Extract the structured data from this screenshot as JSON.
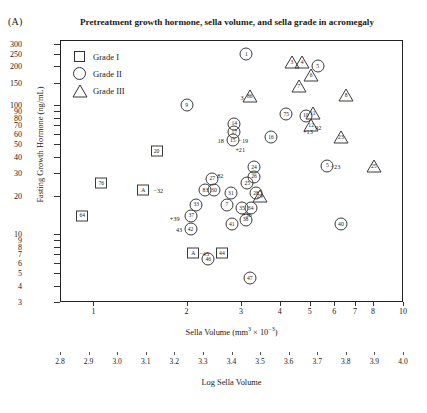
{
  "panel": {
    "label": "(A)"
  },
  "title": "Pretreatment growth hormone, sella volume, and sella grade in acromegaly",
  "legend": {
    "items": [
      {
        "symbol": "square",
        "label": "Grade I"
      },
      {
        "symbol": "circle",
        "label": "Grade II"
      },
      {
        "symbol": "triangle",
        "label": "Grade III"
      }
    ]
  },
  "chart_data": {
    "type": "scatter",
    "title": "Pretreatment growth hormone, sella volume, and sella grade in acromegaly",
    "xlabel": "Sella Volume (mm³ × 10⁻³)",
    "xlabel_secondary": "Log Sella Volume",
    "ylabel": "Fasting Growth Hormone (ng/mL)",
    "xscale": "log",
    "yscale": "log",
    "xlim": [
      0.78,
      10.0
    ],
    "ylim": [
      3,
      320
    ],
    "grid": false,
    "legend_position": "top-left inside axes",
    "xticks": [
      1,
      2,
      3,
      4,
      5,
      6,
      7,
      8,
      10
    ],
    "xticklabels": [
      "1",
      "2",
      "3",
      "4",
      "5",
      "6",
      "7",
      "8",
      "10"
    ],
    "xticks_secondary": [
      2.8,
      2.9,
      3.0,
      3.1,
      3.2,
      3.3,
      3.4,
      3.5,
      3.6,
      3.7,
      3.8,
      3.9,
      4.0
    ],
    "xticklabels_secondary": [
      "2.8",
      "2.9",
      "3.0",
      "3.1",
      "3.2",
      "3.3",
      "3.4",
      "3.5",
      "3.6",
      "3.7",
      "3.8",
      "3.9",
      "4.0"
    ],
    "yticks": [
      3,
      4,
      5,
      6,
      7,
      8,
      9,
      10,
      20,
      30,
      40,
      50,
      60,
      70,
      80,
      90,
      100,
      150,
      200,
      250,
      300
    ],
    "yticklabels": [
      "3",
      "4",
      "5",
      "6",
      "7",
      "8",
      "9",
      "10",
      "20",
      "30",
      "40",
      "50",
      "60",
      "70",
      "80",
      "90",
      "100",
      "150",
      "200",
      "250",
      "300"
    ],
    "series": [
      {
        "name": "Grade I",
        "symbol": "square",
        "points": [
          {
            "id": "20",
            "x": 1.6,
            "y": 44
          },
          {
            "id": "76",
            "x": 1.06,
            "y": 25
          },
          {
            "id": "64",
            "x": 0.92,
            "y": 14
          },
          {
            "id": "44",
            "x": 2.6,
            "y": 7.2
          }
        ]
      },
      {
        "name": "Grade II",
        "symbol": "circle",
        "points": [
          {
            "id": "1",
            "x": 3.12,
            "y": 250
          },
          {
            "id": "5",
            "x": 5.3,
            "y": 200
          },
          {
            "id": "9",
            "x": 2.0,
            "y": 100
          },
          {
            "id": "75",
            "x": 4.2,
            "y": 85
          },
          {
            "id": "10",
            "x": 4.85,
            "y": 83
          },
          {
            "id": "14",
            "x": 2.85,
            "y": 72
          },
          {
            "id": "17",
            "x": 2.85,
            "y": 62
          },
          {
            "id": "15",
            "x": 2.82,
            "y": 54
          },
          {
            "id": "16",
            "x": 3.75,
            "y": 57
          },
          {
            "id": "5b",
            "x": 5.7,
            "y": 34
          },
          {
            "id": "27",
            "x": 2.42,
            "y": 27
          },
          {
            "id": "24",
            "x": 3.3,
            "y": 33
          },
          {
            "id": "26",
            "x": 3.3,
            "y": 28
          },
          {
            "id": "25",
            "x": 3.14,
            "y": 25
          },
          {
            "id": "83",
            "x": 2.3,
            "y": 22
          },
          {
            "id": "30",
            "x": 2.45,
            "y": 22
          },
          {
            "id": "31",
            "x": 2.78,
            "y": 21
          },
          {
            "id": "28",
            "x": 3.35,
            "y": 21
          },
          {
            "id": "33",
            "x": 2.15,
            "y": 17
          },
          {
            "id": "7",
            "x": 2.7,
            "y": 17
          },
          {
            "id": "35",
            "x": 3.02,
            "y": 16
          },
          {
            "id": "34",
            "x": 3.22,
            "y": 16
          },
          {
            "id": "37",
            "x": 2.07,
            "y": 14
          },
          {
            "id": "38",
            "x": 3.1,
            "y": 13
          },
          {
            "id": "41",
            "x": 2.8,
            "y": 12
          },
          {
            "id": "42",
            "x": 2.06,
            "y": 11
          },
          {
            "id": "40",
            "x": 6.3,
            "y": 12
          },
          {
            "id": "46",
            "x": 2.35,
            "y": 6.4
          },
          {
            "id": "47",
            "x": 3.2,
            "y": 4.6
          }
        ]
      },
      {
        "name": "Grade III",
        "symbol": "triangle",
        "points": [
          {
            "id": "3",
            "x": 4.38,
            "y": 215
          },
          {
            "id": "4",
            "x": 4.72,
            "y": 215
          },
          {
            "id": "6",
            "x": 5.05,
            "y": 170
          },
          {
            "id": "7b",
            "x": 4.6,
            "y": 140
          },
          {
            "id": "8",
            "x": 6.55,
            "y": 120
          },
          {
            "id": "86",
            "x": 3.2,
            "y": 118
          },
          {
            "id": "11",
            "x": 5.12,
            "y": 87
          },
          {
            "id": "12",
            "x": 5.05,
            "y": 70
          },
          {
            "id": "23",
            "x": 6.3,
            "y": 57
          },
          {
            "id": "25b",
            "x": 8.05,
            "y": 34
          },
          {
            "id": "29",
            "x": 3.45,
            "y": 20
          }
        ]
      }
    ],
    "annotations": [
      {
        "text": "−32",
        "x": 1.62,
        "y": 22
      },
      {
        "text": "−45",
        "x": 2.28,
        "y": 7.2
      },
      {
        "text": "−19",
        "x": 3.05,
        "y": 54
      },
      {
        "text": "18",
        "x": 2.58,
        "y": 54
      },
      {
        "text": "+21",
        "x": 2.98,
        "y": 46
      },
      {
        "text": "+13",
        "x": 4.93,
        "y": 63
      },
      {
        "text": "+39",
        "x": 1.83,
        "y": 13.5
      },
      {
        "text": "+36",
        "x": 3.13,
        "y": 14.3
      },
      {
        "text": "43",
        "x": 1.89,
        "y": 11
      },
      {
        "text": "82",
        "x": 2.57,
        "y": 29
      },
      {
        "text": "92",
        "x": 5.32,
        "y": 68
      },
      {
        "text": "−23",
        "x": 6.05,
        "y": 34
      },
      {
        "text": "3",
        "x": 3.02,
        "y": 115
      }
    ],
    "bracket_markers": [
      {
        "label": "A",
        "note": "−32",
        "x": 1.45,
        "y": 22
      },
      {
        "label": "A",
        "note": "−45",
        "x": 2.1,
        "y": 7.2
      }
    ]
  }
}
